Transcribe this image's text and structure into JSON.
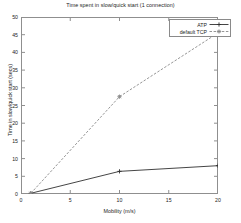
{
  "chart_data": {
    "type": "line",
    "title": "Time spent in slow/quick start (1 connection)",
    "xlabel": "Mobility (m/s)",
    "ylabel": "Time in slow/quick start (secs)",
    "xlim": [
      0,
      20
    ],
    "ylim": [
      0,
      50
    ],
    "xticks": [
      0,
      5,
      10,
      15,
      20
    ],
    "yticks": [
      0,
      5,
      10,
      15,
      20,
      25,
      30,
      35,
      40,
      45,
      50
    ],
    "grid": false,
    "legend_position": "top-right",
    "x": [
      1,
      10,
      20
    ],
    "series": [
      {
        "name": "ATP",
        "values": [
          0.2,
          6.4,
          8.0
        ],
        "color": "#303030",
        "style": "solid",
        "marker": "plus"
      },
      {
        "name": "default TCP",
        "values": [
          0.2,
          27.5,
          45.5
        ],
        "color": "#8a8a8a",
        "style": "dashed",
        "marker": "cross"
      }
    ]
  },
  "axis": {
    "xticklabels": [
      "0",
      "5",
      "10",
      "15",
      "20"
    ],
    "yticklabels": [
      "0",
      "5",
      "10",
      "15",
      "20",
      "25",
      "30",
      "35",
      "40",
      "45",
      "50"
    ]
  },
  "legend": {
    "entries": [
      {
        "label": "ATP"
      },
      {
        "label": "default TCP"
      }
    ]
  },
  "colors": {
    "background": "#ffffff",
    "frame": "#8f8f8f",
    "text": "#1d1d1d",
    "series_atp": "#303030",
    "series_tcp": "#8a8a8a"
  }
}
